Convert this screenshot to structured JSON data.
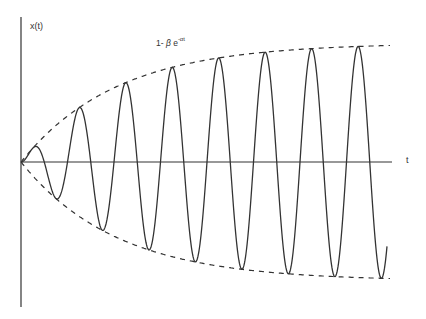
{
  "diagram": {
    "title": "",
    "y_axis_label": "x(t)",
    "x_axis_label": "t",
    "envelope_label": {
      "prefix": "1- ",
      "beta": "β",
      "base": " e",
      "exponent": "-αt"
    },
    "colors": {
      "background": "#ffffff",
      "line": "#333333"
    }
  },
  "chart_data": {
    "type": "line",
    "title": "",
    "xlabel": "t",
    "ylabel": "x(t)",
    "grid": false,
    "legend": "none",
    "series": [
      {
        "name": "x(t) oscillation",
        "style": "solid",
        "description": "sinusoid with growing amplitude, ~8 full cycles",
        "peaks_px": [
          [
            36,
            146
          ],
          [
            78,
            105
          ],
          [
            125,
            80
          ],
          [
            170,
            64
          ],
          [
            217,
            55
          ],
          [
            263,
            49
          ],
          [
            310,
            45
          ],
          [
            357,
            44
          ]
        ],
        "troughs_px": [
          [
            55,
            178
          ],
          [
            101,
            219
          ],
          [
            148,
            253
          ],
          [
            194,
            263
          ],
          [
            240,
            271
          ],
          [
            287,
            276
          ],
          [
            333,
            279
          ],
          [
            380,
            280
          ]
        ]
      },
      {
        "name": "upper envelope 1-βe^(-αt)",
        "style": "dashed"
      },
      {
        "name": "lower envelope -(1-βe^(-αt))",
        "style": "dashed"
      }
    ],
    "annotations": [
      "1- β e^(-αt)"
    ]
  }
}
